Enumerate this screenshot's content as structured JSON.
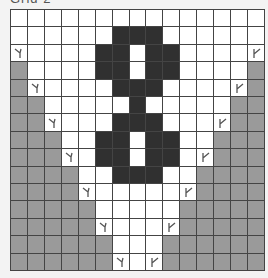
{
  "title": "Grid 2",
  "colors": {
    "white": "#ffffff",
    "black": "#303030",
    "gray": "#9a9a9a",
    "grid_line": "#444444",
    "background": "#f3f3f3"
  },
  "legend": {
    "W": "empty",
    "B": "wall",
    "G": "filled",
    "L": "marker-left",
    "R": "marker-right"
  },
  "grid": {
    "rows": 15,
    "cols": 15,
    "cells": [
      "WWWWWWWWWWWWWWW",
      "WWWWWWBBBWWWWWW",
      "LWWWWBBWBBWWWWR",
      "GWWWWBBWBBWWWWG",
      "GLWWWWBBBWWWWRG",
      "GGWWWWWBWWWWWGG",
      "GGLWWWBBBWWWRGG",
      "GGGWWBBWBBWWGGG",
      "GGGLWBBWBBWRGGG",
      "GGGGWWBBBWWGGGG",
      "GGGGLWWWWWRGGGG",
      "GGGGGWWWWWGGGGG",
      "GGGGGLWWWRGGGGG",
      "GGGGGGWWWGGGGGG",
      "GGGGGGLWRGGGGGG"
    ]
  }
}
